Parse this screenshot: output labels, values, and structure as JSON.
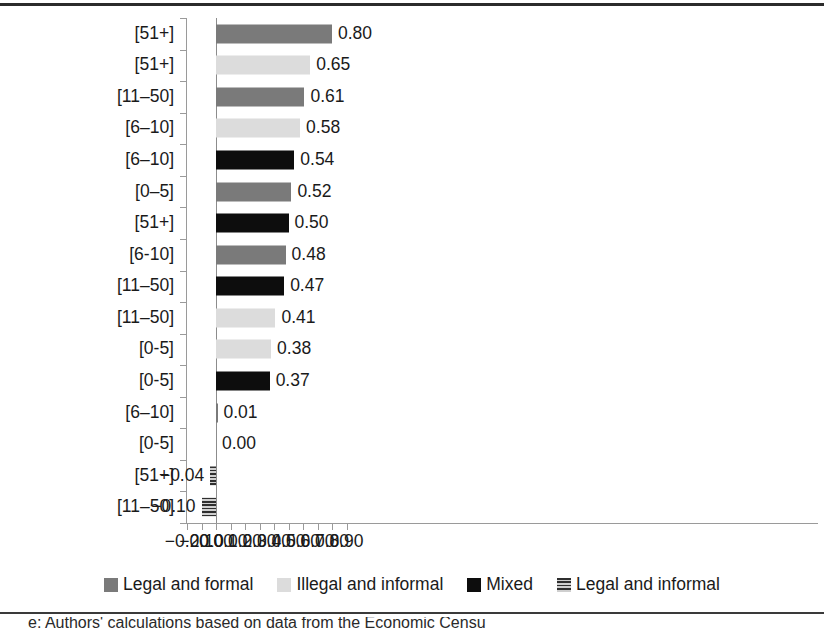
{
  "chart_data": {
    "type": "bar",
    "orientation": "horizontal",
    "title": "",
    "subtitle": "",
    "xlabel": "",
    "ylabel": "",
    "xlim": [
      -0.2,
      0.9
    ],
    "xticks": [
      "-0.20",
      "-0.10",
      "0.00",
      "0.10",
      "0.20",
      "0.30",
      "0.40",
      "0.50",
      "0.60",
      "0.70",
      "0.80",
      "0.90"
    ],
    "xtick_values": [
      -0.2,
      -0.1,
      0.0,
      0.1,
      0.2,
      0.3,
      0.4,
      0.5,
      0.6,
      0.7,
      0.8,
      0.9
    ],
    "grid": false,
    "legend_position": "bottom",
    "right_edge_clipped": true,
    "categories": [
      "[51+]",
      "[51+]",
      "[11–50]",
      "[6–10]",
      "[6–10]",
      "[0–5]",
      "[51+]",
      "[6-10]",
      "[11–50]",
      "[11–50]",
      "[0-5]",
      "[0-5]",
      "[6–10]",
      "[0-5]",
      "[51+]",
      "[11–50]"
    ],
    "values": [
      0.8,
      0.65,
      0.61,
      0.58,
      0.54,
      0.52,
      0.5,
      0.48,
      0.47,
      0.41,
      0.38,
      0.37,
      0.01,
      0.0,
      -0.04,
      -0.1
    ],
    "value_labels": [
      "0.80",
      "0.65",
      "0.61",
      "0.58",
      "0.54",
      "0.52",
      "0.50",
      "0.48",
      "0.47",
      "0.41",
      "0.38",
      "0.37",
      "0.01",
      "0.00",
      "−0.04",
      "−0.10"
    ],
    "series_of_bar": [
      "legal-formal",
      "illegal-informal",
      "legal-formal",
      "illegal-informal",
      "mixed",
      "legal-formal",
      "mixed",
      "legal-formal",
      "mixed",
      "illegal-informal",
      "illegal-informal",
      "mixed",
      "legal-formal",
      "illegal-informal",
      "legal-informal",
      "legal-informal"
    ],
    "legend": [
      {
        "key": "legal-formal",
        "label": "Legal and formal",
        "color": "#7a7a7a"
      },
      {
        "key": "illegal-informal",
        "label": "Illegal and informal",
        "color": "#dcdcdc"
      },
      {
        "key": "mixed",
        "label": "Mixed",
        "color": "#0d0d0d"
      },
      {
        "key": "legal-informal",
        "label": "Legal and informal",
        "color": "#2f2f2f"
      }
    ]
  },
  "caption": {
    "text": "e: Authors' calculations based on data from the Economic Censu"
  }
}
